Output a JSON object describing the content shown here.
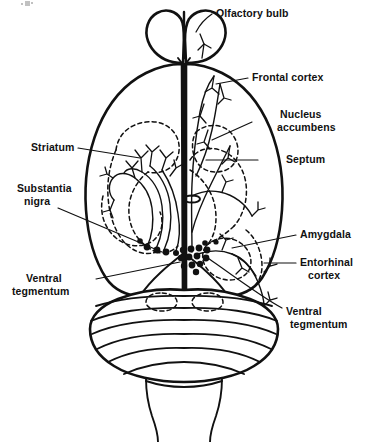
{
  "figure": {
    "background_color": "#ffffff",
    "ink_color": "#111111",
    "width": 366,
    "height": 442
  },
  "labels": {
    "olfactory_bulb": "Olfactory bulb",
    "frontal_cortex": "Frontal cortex",
    "nucleus_accumbens_line1": "Nucleus",
    "nucleus_accumbens_line2": "accumbens",
    "septum": "Septum",
    "amygdala": "Amygdala",
    "entorhinal_cortex_line1": "Entorhinal",
    "entorhinal_cortex_line2": "cortex",
    "ventral_tegmentum_right_line1": "Ventral",
    "ventral_tegmentum_right_line2": "tegmentum",
    "striatum": "Striatum",
    "substantia_nigra_line1": "Substantia",
    "substantia_nigra_line2": "nigra",
    "ventral_tegmentum_left_line1": "Ventral",
    "ventral_tegmentum_left_line2": "tegmentum"
  },
  "structures": [
    {
      "name": "olfactory-bulb",
      "side": "both",
      "render": "solid-outline"
    },
    {
      "name": "cerebral-cortex",
      "side": "both",
      "render": "solid-outline"
    },
    {
      "name": "cerebellum",
      "side": "both",
      "render": "solid-outline-folia"
    },
    {
      "name": "brainstem",
      "side": "both",
      "render": "solid-outline"
    },
    {
      "name": "striatum",
      "side": "left",
      "render": "dashed-outline"
    },
    {
      "name": "nucleus-accumbens",
      "side": "right",
      "render": "dashed-outline"
    },
    {
      "name": "septum",
      "side": "right",
      "render": "dashed-outline"
    },
    {
      "name": "amygdala",
      "side": "right",
      "render": "dashed-outline"
    },
    {
      "name": "entorhinal-cortex",
      "side": "right",
      "render": "dashed-outline"
    },
    {
      "name": "substantia-nigra",
      "side": "left",
      "render": "cell-body-dots"
    },
    {
      "name": "ventral-tegmentum",
      "side": "midline",
      "render": "cell-body-dots"
    }
  ],
  "pathways": [
    {
      "name": "nigrostriatal",
      "side": "left",
      "from": "substantia nigra",
      "to": "striatum"
    },
    {
      "name": "mesolimbic",
      "side": "right",
      "from": "ventral tegmentum",
      "to": "nucleus accumbens"
    },
    {
      "name": "mesocortical",
      "side": "right",
      "from": "ventral tegmentum",
      "to": "frontal cortex"
    }
  ],
  "cell_body_dots": {
    "substantia_nigra_count": 5,
    "ventral_tegmentum_count": 14
  }
}
